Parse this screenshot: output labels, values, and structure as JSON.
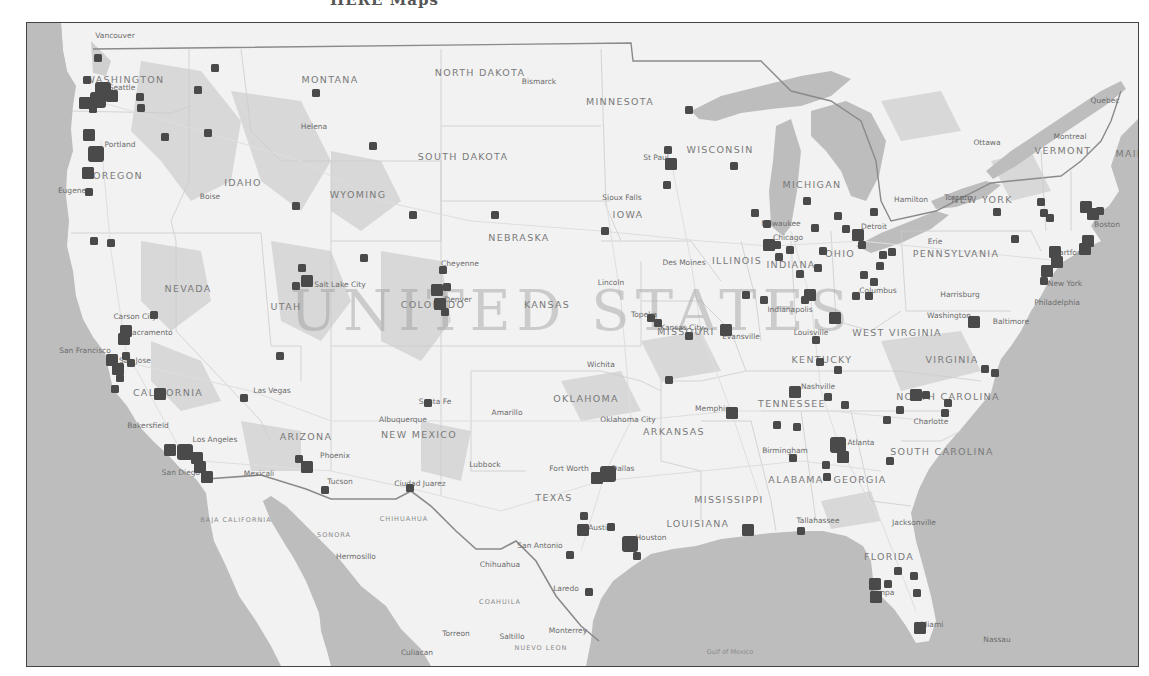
{
  "page": {
    "caption_fragment": "HERE Maps",
    "country_label": "UNITED STATES"
  },
  "colors": {
    "water": "#bdbdbd",
    "land": "#f2f2f2",
    "terrain": "#d6d6d6",
    "marker": "#4a4a4a",
    "border": "#7a7a7a"
  },
  "labels": {
    "states": [
      {
        "text": "WASHINGTON",
        "x": 125,
        "y": 80
      },
      {
        "text": "MONTANA",
        "x": 330,
        "y": 80
      },
      {
        "text": "NORTH DAKOTA",
        "x": 480,
        "y": 73
      },
      {
        "text": "MINNESOTA",
        "x": 620,
        "y": 102
      },
      {
        "text": "WISCONSIN",
        "x": 720,
        "y": 150
      },
      {
        "text": "SOUTH DAKOTA",
        "x": 463,
        "y": 157
      },
      {
        "text": "OREGON",
        "x": 118,
        "y": 176
      },
      {
        "text": "IDAHO",
        "x": 243,
        "y": 183
      },
      {
        "text": "WYOMING",
        "x": 358,
        "y": 195
      },
      {
        "text": "MICHIGAN",
        "x": 812,
        "y": 185
      },
      {
        "text": "NEW YORK",
        "x": 982,
        "y": 200
      },
      {
        "text": "VERMONT",
        "x": 1063,
        "y": 151
      },
      {
        "text": "IOWA",
        "x": 628,
        "y": 215
      },
      {
        "text": "NEBRASKA",
        "x": 519,
        "y": 238
      },
      {
        "text": "NEVADA",
        "x": 188,
        "y": 289
      },
      {
        "text": "UTAH",
        "x": 286,
        "y": 307
      },
      {
        "text": "COLORADO",
        "x": 433,
        "y": 305
      },
      {
        "text": "KANSAS",
        "x": 547,
        "y": 305
      },
      {
        "text": "ILLINOIS",
        "x": 737,
        "y": 261
      },
      {
        "text": "INDIANA",
        "x": 791,
        "y": 265
      },
      {
        "text": "OHIO",
        "x": 840,
        "y": 254
      },
      {
        "text": "PENNSYLVANIA",
        "x": 956,
        "y": 254
      },
      {
        "text": "MISSOURI",
        "x": 686,
        "y": 332
      },
      {
        "text": "WEST VIRGINIA",
        "x": 897,
        "y": 333
      },
      {
        "text": "KENTUCKY",
        "x": 822,
        "y": 360
      },
      {
        "text": "VIRGINIA",
        "x": 952,
        "y": 360
      },
      {
        "text": "CALIFORNIA",
        "x": 168,
        "y": 393
      },
      {
        "text": "OKLAHOMA",
        "x": 586,
        "y": 399
      },
      {
        "text": "TENNESSEE",
        "x": 792,
        "y": 404
      },
      {
        "text": "NORTH CAROLINA",
        "x": 948,
        "y": 397
      },
      {
        "text": "ARIZONA",
        "x": 306,
        "y": 437
      },
      {
        "text": "NEW MEXICO",
        "x": 419,
        "y": 435
      },
      {
        "text": "ARKANSAS",
        "x": 674,
        "y": 432
      },
      {
        "text": "SOUTH CAROLINA",
        "x": 942,
        "y": 452
      },
      {
        "text": "ALABAMA",
        "x": 796,
        "y": 480
      },
      {
        "text": "GEORGIA",
        "x": 860,
        "y": 480
      },
      {
        "text": "TEXAS",
        "x": 554,
        "y": 498
      },
      {
        "text": "MISSISSIPPI",
        "x": 729,
        "y": 500
      },
      {
        "text": "LOUISIANA",
        "x": 698,
        "y": 524
      },
      {
        "text": "FLORIDA",
        "x": 889,
        "y": 557
      },
      {
        "text": "MAINE",
        "x": 1134,
        "y": 154
      }
    ],
    "cities": [
      {
        "text": "Vancouver",
        "x": 115,
        "y": 36
      },
      {
        "text": "Seattle",
        "x": 122,
        "y": 88
      },
      {
        "text": "Portland",
        "x": 120,
        "y": 145
      },
      {
        "text": "Eugene",
        "x": 72,
        "y": 191
      },
      {
        "text": "Boise",
        "x": 210,
        "y": 197
      },
      {
        "text": "Helena",
        "x": 314,
        "y": 127
      },
      {
        "text": "Bismarck",
        "x": 539,
        "y": 82
      },
      {
        "text": "St Paul",
        "x": 656,
        "y": 158
      },
      {
        "text": "Sioux Falls",
        "x": 622,
        "y": 198
      },
      {
        "text": "Milwaukee",
        "x": 781,
        "y": 224
      },
      {
        "text": "Chicago",
        "x": 788,
        "y": 238
      },
      {
        "text": "Detroit",
        "x": 874,
        "y": 227
      },
      {
        "text": "Hamilton",
        "x": 911,
        "y": 200
      },
      {
        "text": "Toronto",
        "x": 958,
        "y": 198
      },
      {
        "text": "Ottawa",
        "x": 987,
        "y": 143
      },
      {
        "text": "Montreal",
        "x": 1070,
        "y": 137
      },
      {
        "text": "Quebec",
        "x": 1105,
        "y": 101
      },
      {
        "text": "Erie",
        "x": 935,
        "y": 242
      },
      {
        "text": "Boston",
        "x": 1107,
        "y": 225
      },
      {
        "text": "Hartford",
        "x": 1069,
        "y": 253
      },
      {
        "text": "New York",
        "x": 1065,
        "y": 284
      },
      {
        "text": "Philadelphia",
        "x": 1057,
        "y": 303
      },
      {
        "text": "Harrisburg",
        "x": 960,
        "y": 295
      },
      {
        "text": "Baltimore",
        "x": 1011,
        "y": 322
      },
      {
        "text": "Washington",
        "x": 949,
        "y": 316
      },
      {
        "text": "Columbus",
        "x": 878,
        "y": 291
      },
      {
        "text": "Indianapolis",
        "x": 790,
        "y": 310
      },
      {
        "text": "Cheyenne",
        "x": 460,
        "y": 264
      },
      {
        "text": "Denver",
        "x": 458,
        "y": 300
      },
      {
        "text": "Salt Lake City",
        "x": 340,
        "y": 285
      },
      {
        "text": "Des Moines",
        "x": 684,
        "y": 263
      },
      {
        "text": "Lincoln",
        "x": 611,
        "y": 283
      },
      {
        "text": "Topeka",
        "x": 644,
        "y": 315
      },
      {
        "text": "Kansas City",
        "x": 682,
        "y": 328
      },
      {
        "text": "Evansville",
        "x": 741,
        "y": 337
      },
      {
        "text": "Louisville",
        "x": 811,
        "y": 333
      },
      {
        "text": "Nashville",
        "x": 818,
        "y": 387
      },
      {
        "text": "Memphis",
        "x": 712,
        "y": 409
      },
      {
        "text": "Birmingham",
        "x": 785,
        "y": 451
      },
      {
        "text": "Charlotte",
        "x": 931,
        "y": 422
      },
      {
        "text": "Atlanta",
        "x": 861,
        "y": 443
      },
      {
        "text": "Wichita",
        "x": 601,
        "y": 365
      },
      {
        "text": "Oklahoma City",
        "x": 628,
        "y": 420
      },
      {
        "text": "Amarillo",
        "x": 507,
        "y": 413
      },
      {
        "text": "Albuquerque",
        "x": 403,
        "y": 420
      },
      {
        "text": "Santa Fe",
        "x": 435,
        "y": 402
      },
      {
        "text": "Lubbock",
        "x": 485,
        "y": 465
      },
      {
        "text": "Fort Worth",
        "x": 569,
        "y": 469
      },
      {
        "text": "Dallas",
        "x": 623,
        "y": 469
      },
      {
        "text": "Austin",
        "x": 600,
        "y": 528
      },
      {
        "text": "Houston",
        "x": 651,
        "y": 538
      },
      {
        "text": "San Antonio",
        "x": 540,
        "y": 546
      },
      {
        "text": "Laredo",
        "x": 566,
        "y": 589
      },
      {
        "text": "Monterrey",
        "x": 568,
        "y": 631
      },
      {
        "text": "Saltillo",
        "x": 512,
        "y": 637
      },
      {
        "text": "Torreon",
        "x": 456,
        "y": 634
      },
      {
        "text": "Chihuahua",
        "x": 500,
        "y": 565
      },
      {
        "text": "Ciudad Juarez",
        "x": 420,
        "y": 484
      },
      {
        "text": "Tucson",
        "x": 340,
        "y": 482
      },
      {
        "text": "Phoenix",
        "x": 335,
        "y": 456
      },
      {
        "text": "Mexicali",
        "x": 259,
        "y": 474
      },
      {
        "text": "San Diego",
        "x": 181,
        "y": 473
      },
      {
        "text": "Los Angeles",
        "x": 215,
        "y": 440
      },
      {
        "text": "Las Vegas",
        "x": 272,
        "y": 391
      },
      {
        "text": "Bakersfield",
        "x": 148,
        "y": 426
      },
      {
        "text": "San Francisco",
        "x": 85,
        "y": 351
      },
      {
        "text": "San Jose",
        "x": 135,
        "y": 361
      },
      {
        "text": "Sacramento",
        "x": 150,
        "y": 333
      },
      {
        "text": "Carson City",
        "x": 135,
        "y": 317
      },
      {
        "text": "Hermosillo",
        "x": 356,
        "y": 557
      },
      {
        "text": "Culiacan",
        "x": 417,
        "y": 653
      },
      {
        "text": "Tallahassee",
        "x": 818,
        "y": 521
      },
      {
        "text": "Jacksonville",
        "x": 914,
        "y": 523
      },
      {
        "text": "Tampa",
        "x": 882,
        "y": 593
      },
      {
        "text": "Miami",
        "x": 932,
        "y": 625
      },
      {
        "text": "Nassau",
        "x": 997,
        "y": 640
      }
    ],
    "mexico_regions": [
      {
        "text": "BAJA CALIFORNIA",
        "x": 236,
        "y": 520
      },
      {
        "text": "SONORA",
        "x": 334,
        "y": 535
      },
      {
        "text": "CHIHUAHUA",
        "x": 404,
        "y": 519
      },
      {
        "text": "COAHUILA",
        "x": 500,
        "y": 602
      },
      {
        "text": "NUEVO LEON",
        "x": 541,
        "y": 648
      }
    ],
    "water": [
      {
        "text": "Gulf of Mexico",
        "x": 730,
        "y": 652
      }
    ]
  },
  "markers": [
    {
      "x": 98,
      "y": 58,
      "s": "sm"
    },
    {
      "x": 87,
      "y": 80,
      "s": "sm"
    },
    {
      "x": 103,
      "y": 90,
      "s": "xl"
    },
    {
      "x": 98,
      "y": 100,
      "s": "xl"
    },
    {
      "x": 112,
      "y": 96,
      "s": "lg"
    },
    {
      "x": 85,
      "y": 103,
      "s": "lg"
    },
    {
      "x": 93,
      "y": 109,
      "s": "sm"
    },
    {
      "x": 140,
      "y": 97,
      "s": "sm"
    },
    {
      "x": 141,
      "y": 108,
      "s": "sm"
    },
    {
      "x": 215,
      "y": 68,
      "s": "sm"
    },
    {
      "x": 198,
      "y": 90,
      "s": "sm"
    },
    {
      "x": 165,
      "y": 137,
      "s": "sm"
    },
    {
      "x": 208,
      "y": 133,
      "s": "sm"
    },
    {
      "x": 316,
      "y": 93,
      "s": "sm"
    },
    {
      "x": 373,
      "y": 146,
      "s": "sm"
    },
    {
      "x": 89,
      "y": 135,
      "s": "lg"
    },
    {
      "x": 96,
      "y": 154,
      "s": "xl"
    },
    {
      "x": 88,
      "y": 173,
      "s": "lg"
    },
    {
      "x": 89,
      "y": 192,
      "s": "sm"
    },
    {
      "x": 296,
      "y": 206,
      "s": "sm"
    },
    {
      "x": 94,
      "y": 241,
      "s": "sm"
    },
    {
      "x": 111,
      "y": 243,
      "s": "sm"
    },
    {
      "x": 364,
      "y": 258,
      "s": "sm"
    },
    {
      "x": 302,
      "y": 268,
      "s": "sm"
    },
    {
      "x": 307,
      "y": 281,
      "s": "lg"
    },
    {
      "x": 296,
      "y": 286,
      "s": "sm"
    },
    {
      "x": 154,
      "y": 315,
      "s": "sm"
    },
    {
      "x": 126,
      "y": 331,
      "s": "lg"
    },
    {
      "x": 124,
      "y": 339,
      "s": "lg"
    },
    {
      "x": 126,
      "y": 356,
      "s": "sm"
    },
    {
      "x": 112,
      "y": 360,
      "s": "lg"
    },
    {
      "x": 118,
      "y": 369,
      "s": "lg"
    },
    {
      "x": 120,
      "y": 378,
      "s": "sm"
    },
    {
      "x": 131,
      "y": 363,
      "s": "sm"
    },
    {
      "x": 115,
      "y": 389,
      "s": "sm"
    },
    {
      "x": 160,
      "y": 394,
      "s": "lg"
    },
    {
      "x": 280,
      "y": 356,
      "s": "sm"
    },
    {
      "x": 244,
      "y": 398,
      "s": "sm"
    },
    {
      "x": 170,
      "y": 450,
      "s": "lg"
    },
    {
      "x": 185,
      "y": 452,
      "s": "xl"
    },
    {
      "x": 197,
      "y": 458,
      "s": "lg"
    },
    {
      "x": 200,
      "y": 467,
      "s": "lg"
    },
    {
      "x": 207,
      "y": 477,
      "s": "lg"
    },
    {
      "x": 299,
      "y": 459,
      "s": "sm"
    },
    {
      "x": 307,
      "y": 467,
      "s": "lg"
    },
    {
      "x": 325,
      "y": 490,
      "s": "sm"
    },
    {
      "x": 410,
      "y": 488,
      "s": "sm"
    },
    {
      "x": 428,
      "y": 403,
      "s": "sm"
    },
    {
      "x": 443,
      "y": 270,
      "s": "sm"
    },
    {
      "x": 437,
      "y": 290,
      "s": "lg"
    },
    {
      "x": 447,
      "y": 287,
      "s": "sm"
    },
    {
      "x": 440,
      "y": 304,
      "s": "lg"
    },
    {
      "x": 445,
      "y": 312,
      "s": "sm"
    },
    {
      "x": 495,
      "y": 215,
      "s": "sm"
    },
    {
      "x": 413,
      "y": 215,
      "s": "sm"
    },
    {
      "x": 605,
      "y": 231,
      "s": "sm"
    },
    {
      "x": 668,
      "y": 150,
      "s": "sm"
    },
    {
      "x": 671,
      "y": 164,
      "s": "lg"
    },
    {
      "x": 667,
      "y": 185,
      "s": "sm"
    },
    {
      "x": 689,
      "y": 110,
      "s": "sm"
    },
    {
      "x": 734,
      "y": 166,
      "s": "sm"
    },
    {
      "x": 755,
      "y": 213,
      "s": "sm"
    },
    {
      "x": 767,
      "y": 224,
      "s": "sm"
    },
    {
      "x": 769,
      "y": 245,
      "s": "lg"
    },
    {
      "x": 777,
      "y": 245,
      "s": "sm"
    },
    {
      "x": 779,
      "y": 257,
      "s": "sm"
    },
    {
      "x": 790,
      "y": 250,
      "s": "sm"
    },
    {
      "x": 807,
      "y": 201,
      "s": "sm"
    },
    {
      "x": 815,
      "y": 228,
      "s": "sm"
    },
    {
      "x": 823,
      "y": 251,
      "s": "sm"
    },
    {
      "x": 838,
      "y": 216,
      "s": "sm"
    },
    {
      "x": 846,
      "y": 229,
      "s": "sm"
    },
    {
      "x": 858,
      "y": 235,
      "s": "lg"
    },
    {
      "x": 862,
      "y": 245,
      "s": "sm"
    },
    {
      "x": 874,
      "y": 212,
      "s": "sm"
    },
    {
      "x": 883,
      "y": 255,
      "s": "sm"
    },
    {
      "x": 892,
      "y": 252,
      "s": "sm"
    },
    {
      "x": 880,
      "y": 266,
      "s": "sm"
    },
    {
      "x": 864,
      "y": 275,
      "s": "sm"
    },
    {
      "x": 874,
      "y": 282,
      "s": "sm"
    },
    {
      "x": 856,
      "y": 296,
      "s": "sm"
    },
    {
      "x": 869,
      "y": 296,
      "s": "sm"
    },
    {
      "x": 818,
      "y": 268,
      "s": "sm"
    },
    {
      "x": 810,
      "y": 295,
      "s": "lg"
    },
    {
      "x": 805,
      "y": 300,
      "s": "sm"
    },
    {
      "x": 764,
      "y": 300,
      "s": "sm"
    },
    {
      "x": 800,
      "y": 274,
      "s": "sm"
    },
    {
      "x": 835,
      "y": 318,
      "s": "lg"
    },
    {
      "x": 746,
      "y": 295,
      "s": "sm"
    },
    {
      "x": 651,
      "y": 318,
      "s": "sm"
    },
    {
      "x": 658,
      "y": 323,
      "s": "sm"
    },
    {
      "x": 689,
      "y": 336,
      "s": "sm"
    },
    {
      "x": 726,
      "y": 330,
      "s": "lg"
    },
    {
      "x": 669,
      "y": 380,
      "s": "sm"
    },
    {
      "x": 732,
      "y": 413,
      "s": "lg"
    },
    {
      "x": 816,
      "y": 340,
      "s": "sm"
    },
    {
      "x": 820,
      "y": 362,
      "s": "sm"
    },
    {
      "x": 838,
      "y": 370,
      "s": "sm"
    },
    {
      "x": 795,
      "y": 392,
      "s": "lg"
    },
    {
      "x": 828,
      "y": 397,
      "s": "sm"
    },
    {
      "x": 845,
      "y": 405,
      "s": "sm"
    },
    {
      "x": 777,
      "y": 425,
      "s": "sm"
    },
    {
      "x": 797,
      "y": 427,
      "s": "sm"
    },
    {
      "x": 838,
      "y": 445,
      "s": "xl"
    },
    {
      "x": 843,
      "y": 457,
      "s": "lg"
    },
    {
      "x": 826,
      "y": 465,
      "s": "sm"
    },
    {
      "x": 793,
      "y": 458,
      "s": "sm"
    },
    {
      "x": 827,
      "y": 477,
      "s": "sm"
    },
    {
      "x": 887,
      "y": 420,
      "s": "sm"
    },
    {
      "x": 900,
      "y": 410,
      "s": "sm"
    },
    {
      "x": 916,
      "y": 395,
      "s": "lg"
    },
    {
      "x": 926,
      "y": 395,
      "s": "sm"
    },
    {
      "x": 948,
      "y": 403,
      "s": "sm"
    },
    {
      "x": 945,
      "y": 413,
      "s": "sm"
    },
    {
      "x": 890,
      "y": 461,
      "s": "sm"
    },
    {
      "x": 985,
      "y": 369,
      "s": "sm"
    },
    {
      "x": 995,
      "y": 373,
      "s": "sm"
    },
    {
      "x": 974,
      "y": 322,
      "s": "lg"
    },
    {
      "x": 997,
      "y": 212,
      "s": "sm"
    },
    {
      "x": 1041,
      "y": 202,
      "s": "sm"
    },
    {
      "x": 1015,
      "y": 239,
      "s": "sm"
    },
    {
      "x": 1044,
      "y": 213,
      "s": "sm"
    },
    {
      "x": 1050,
      "y": 218,
      "s": "sm"
    },
    {
      "x": 1086,
      "y": 207,
      "s": "lg"
    },
    {
      "x": 1093,
      "y": 214,
      "s": "lg"
    },
    {
      "x": 1100,
      "y": 211,
      "s": "sm"
    },
    {
      "x": 1088,
      "y": 241,
      "s": "lg"
    },
    {
      "x": 1085,
      "y": 249,
      "s": "lg"
    },
    {
      "x": 1055,
      "y": 252,
      "s": "lg"
    },
    {
      "x": 1057,
      "y": 262,
      "s": "lg"
    },
    {
      "x": 1047,
      "y": 271,
      "s": "lg"
    },
    {
      "x": 1044,
      "y": 281,
      "s": "sm"
    },
    {
      "x": 748,
      "y": 530,
      "s": "lg"
    },
    {
      "x": 801,
      "y": 531,
      "s": "sm"
    },
    {
      "x": 898,
      "y": 571,
      "s": "sm"
    },
    {
      "x": 914,
      "y": 576,
      "s": "sm"
    },
    {
      "x": 875,
      "y": 584,
      "s": "lg"
    },
    {
      "x": 888,
      "y": 584,
      "s": "sm"
    },
    {
      "x": 876,
      "y": 597,
      "s": "lg"
    },
    {
      "x": 917,
      "y": 593,
      "s": "sm"
    },
    {
      "x": 920,
      "y": 628,
      "s": "lg"
    },
    {
      "x": 597,
      "y": 478,
      "s": "lg"
    },
    {
      "x": 608,
      "y": 474,
      "s": "xl"
    },
    {
      "x": 584,
      "y": 516,
      "s": "sm"
    },
    {
      "x": 583,
      "y": 530,
      "s": "lg"
    },
    {
      "x": 611,
      "y": 527,
      "s": "sm"
    },
    {
      "x": 630,
      "y": 544,
      "s": "xl"
    },
    {
      "x": 637,
      "y": 556,
      "s": "sm"
    },
    {
      "x": 570,
      "y": 555,
      "s": "sm"
    },
    {
      "x": 589,
      "y": 592,
      "s": "sm"
    }
  ]
}
